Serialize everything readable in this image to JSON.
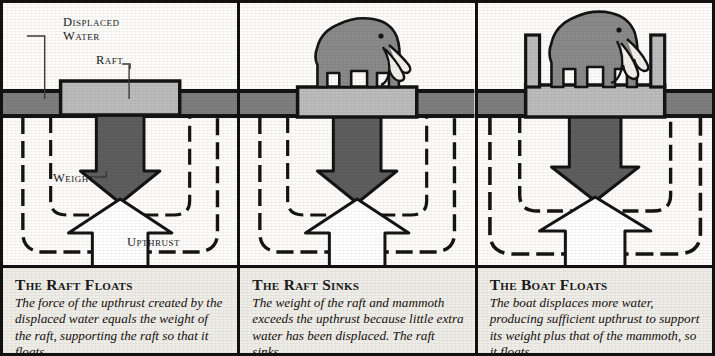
{
  "figure": {
    "colors": {
      "ink": "#111111",
      "water": "#7e7e7e",
      "raft_fill": "#bcbcbc",
      "weight_arrow": "#5e5e5e",
      "upthrust_arrow": "#ffffff",
      "mammoth": "#8a8a8a",
      "tusk": "#f2f0ea",
      "caption_bg": "#efedE8",
      "panel_bg": "#fbfaf7"
    }
  },
  "panels": [
    {
      "id": "raft-floats",
      "caption_title": "The Raft Floats",
      "caption_body": "The force of the upthrust created by the displaced water equals the weight of the raft, supporting the raft so that it floats.",
      "labels": [
        {
          "name": "displaced-water",
          "text_line1": "Displaced",
          "text_line2": "Water"
        },
        {
          "name": "raft",
          "text": "Raft"
        },
        {
          "name": "weight",
          "text": "Weight"
        },
        {
          "name": "upthrust",
          "text": "Upthrust"
        }
      ],
      "has_mammoth": false,
      "has_boat_walls": false
    },
    {
      "id": "raft-sinks",
      "caption_title": "The Raft Sinks",
      "caption_body": "The weight of the raft and mammoth exceeds the upthrust because little extra water has been displaced. The raft sinks.",
      "labels": [],
      "has_mammoth": true,
      "has_boat_walls": false
    },
    {
      "id": "boat-floats",
      "caption_title": "The Boat Floats",
      "caption_body": "The boat displaces more water, producing sufficient upthrust to support its weight plus that of the mammoth, so it floats.",
      "labels": [],
      "has_mammoth": true,
      "has_boat_walls": true
    }
  ]
}
